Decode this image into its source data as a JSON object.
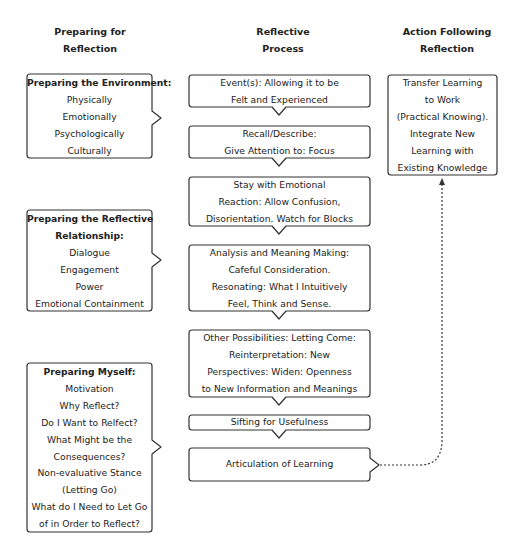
{
  "headers": {
    "left": [
      "Preparing for",
      "Reflection"
    ],
    "middle": [
      "Reflective",
      "Process"
    ],
    "right": [
      "Action Following",
      "Reflection"
    ]
  },
  "left_column": [
    {
      "title": "Preparing the Environment:",
      "title_lines": [
        "Preparing the Environment:"
      ],
      "items": [
        "Physically",
        "Emotionally",
        "Psychologically",
        "Culturally"
      ]
    },
    {
      "title": "Preparing the Reflective Relationship:",
      "title_lines": [
        "Preparing the Reflective",
        "Relationship:"
      ],
      "items": [
        "Dialogue",
        "Engagement",
        "Power",
        "Emotional Containment"
      ]
    },
    {
      "title": "Preparing Myself:",
      "title_lines": [
        "Preparing Myself:"
      ],
      "items": [
        "Motivation",
        "Why Reflect?",
        "Do I Want to Relfect?",
        "What Might be the",
        "Consequences?",
        "Non-evaluative Stance",
        "(Letting Go)",
        "What do I Need to Let Go",
        "of in Order to Reflect?"
      ]
    }
  ],
  "middle_column": [
    {
      "lines": [
        "Event(s): Allowing it to be",
        "Felt and Experienced"
      ]
    },
    {
      "lines": [
        "Recall/Describe:",
        "Give Attention to: Focus"
      ]
    },
    {
      "lines": [
        "Stay with Emotional",
        "Reaction: Allow Confusion,",
        "Disorientation. Watch for Blocks"
      ]
    },
    {
      "lines": [
        "Analysis and Meaning Making:",
        "Cafeful Consideration.",
        "Resonating: What I Intuitively",
        "Feel, Think and Sense."
      ]
    },
    {
      "lines": [
        "Other Possibilities: Letting Come:",
        "Reinterpretation: New",
        "Perspectives: Widen: Openness",
        "to New Information and Meanings"
      ]
    },
    {
      "lines": [
        "Sifting for Usefulness"
      ]
    },
    {
      "lines": [
        "Articulation of Learning"
      ]
    }
  ],
  "right_column": {
    "lines": [
      "Transfer Learning",
      "to Work",
      "(Practical Knowing).",
      "Integrate New",
      "Learning with",
      "Existing Knowledge"
    ]
  },
  "connector": {
    "from": "Articulation of Learning",
    "to": "Transfer Learning to Work",
    "style": "dotted-arrow"
  }
}
